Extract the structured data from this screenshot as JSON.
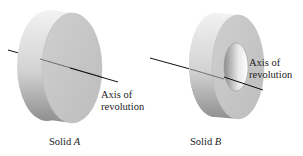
{
  "figure": {
    "solids": [
      {
        "name": "Solid A",
        "caption_prefix": "Solid",
        "caption_letter": "A",
        "shape": "disk",
        "axis_label_line1": "Axis of",
        "axis_label_line2": "revolution"
      },
      {
        "name": "Solid B",
        "caption_prefix": "Solid",
        "caption_letter": "B",
        "shape": "washer",
        "axis_label_line1": "Axis of",
        "axis_label_line2": "revolution"
      }
    ],
    "colors": {
      "background": "#ffffff",
      "surface_light": "#e6e6e6",
      "surface_mid": "#c8c8c8",
      "surface_dark": "#9a9a9a",
      "axis_line": "#111111",
      "text": "#222222"
    }
  }
}
